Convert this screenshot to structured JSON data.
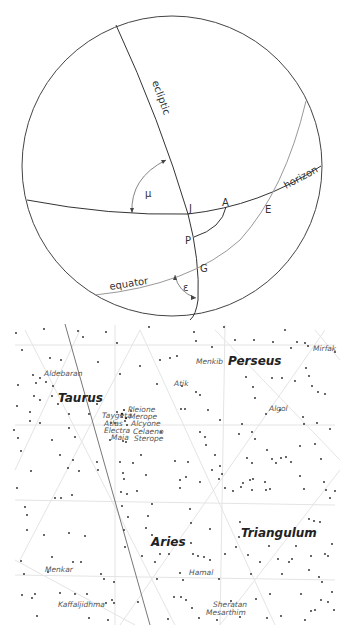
{
  "sphere": {
    "labels": {
      "ecliptic": "ecliptic",
      "horizon": "horizon",
      "equator": "equator",
      "mu": "μ",
      "epsilon": "ε",
      "J": "J",
      "A": "A",
      "E": "E",
      "P": "P",
      "G": "G"
    }
  },
  "starmap": {
    "constellations": [
      "Perseus",
      "Taurus",
      "Aries",
      "Triangulum"
    ],
    "stars": {
      "aldebaran": "Aldebaran",
      "menkib": "Menkib",
      "mirfak": "Mirfak",
      "atik": "Atik",
      "algol": "Algol",
      "pleione": "Pleione",
      "taygeta": "Taygeta",
      "merope": "Merope",
      "atlas": "Atlas",
      "alcyone": "Alcyone",
      "electra": "Electra",
      "celaeno": "Celaeno",
      "maia": "Maia",
      "sterope": "Sterope",
      "menkar": "Menkar",
      "hamal": "Hamal",
      "kaffaljidhma": "Kaffaljidhma",
      "sheratan": "Sheratan",
      "mesarthim": "Mesarthim"
    }
  }
}
